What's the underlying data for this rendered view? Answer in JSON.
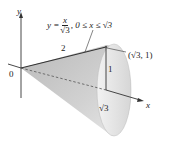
{
  "diagram": {
    "title_formula": {
      "lhs": "y =",
      "numerator": "x",
      "denominator": "√3",
      "domain": ", 0 ≤ x ≤ √3"
    },
    "labels": {
      "y_axis": "y",
      "x_axis": "x",
      "origin": "0",
      "slant_length": "2",
      "height": "1",
      "base_length": "√3",
      "point": "(√3, 1)"
    },
    "colors": {
      "surface": "#cfcfcf",
      "surface_light": "#e6e6e6",
      "lines": "#333333"
    }
  }
}
